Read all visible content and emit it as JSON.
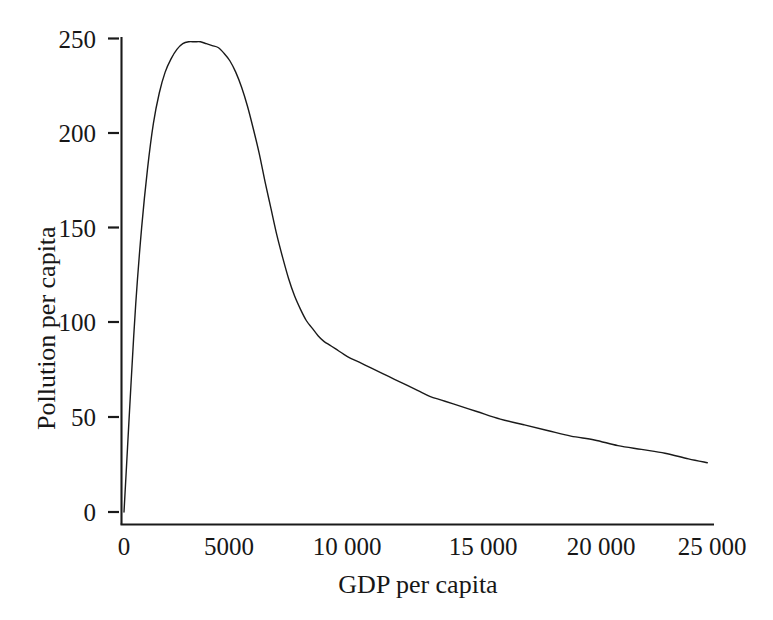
{
  "chart_data": {
    "type": "line",
    "title": "",
    "subtitle": "",
    "xlabel": "GDP per capita",
    "ylabel": "Pollution per capita",
    "xlim": [
      0,
      25500
    ],
    "ylim": [
      0,
      255
    ],
    "grid": false,
    "legend": null,
    "annotations": [],
    "style": {
      "line_color": "#1a1a1a",
      "line_width": 1.4,
      "background": "#ffffff",
      "axis_color": "#1a1a1a",
      "tick_side": "outside-left"
    },
    "xticks": [
      0,
      5000,
      10000,
      15000,
      20000,
      25000
    ],
    "xticklabels": [
      "0",
      "5000",
      "10 000",
      "15 000",
      "20 000",
      "25 000"
    ],
    "yticks": [
      0,
      50,
      100,
      150,
      200,
      250
    ],
    "yticklabels": [
      "0",
      "50",
      "100",
      "150",
      "200",
      "250"
    ],
    "series": [
      {
        "name": "Pollution per capita",
        "x": [
          0,
          150,
          300,
          500,
          750,
          1000,
          1250,
          1500,
          1750,
          2000,
          2250,
          2500,
          2750,
          3000,
          3250,
          3500,
          3750,
          4000,
          4250,
          4500,
          4750,
          5000,
          5250,
          5500,
          5750,
          6000,
          6250,
          6500,
          6750,
          7000,
          7250,
          7500,
          7750,
          8000,
          8250,
          8500,
          8750,
          9000,
          9500,
          10000,
          10500,
          11000,
          11500,
          12000,
          12500,
          13000,
          13500,
          14000,
          15000,
          16000,
          17000,
          18000,
          19000,
          20000,
          21000,
          22000,
          23000,
          24000,
          24800
        ],
        "y": [
          0,
          34,
          68,
          110,
          150,
          181,
          205,
          221,
          232,
          239,
          244,
          247,
          248,
          248,
          248,
          247,
          246,
          245,
          242,
          238,
          232,
          224,
          214,
          202,
          189,
          174,
          160,
          146,
          134,
          123,
          114,
          107,
          101,
          97,
          93,
          90,
          88,
          86,
          82,
          79,
          76,
          73,
          70,
          67,
          64,
          61,
          59,
          57,
          53,
          49,
          46,
          43,
          40,
          38,
          35,
          33,
          31,
          28,
          26
        ]
      }
    ],
    "peak": {
      "x": 3000,
      "y": 248
    },
    "endpoint": {
      "x": 24800,
      "y": 26
    },
    "start": {
      "x": 0,
      "y": 0
    }
  },
  "axes": {
    "x_title": "GDP per capita",
    "y_title": "Pollution  per capita",
    "x_tick_labels": [
      "0",
      "5000",
      "10 000",
      "15 000",
      "20 000",
      "25 000"
    ],
    "y_tick_labels": [
      "0",
      "50",
      "100",
      "150",
      "200",
      "250"
    ]
  }
}
